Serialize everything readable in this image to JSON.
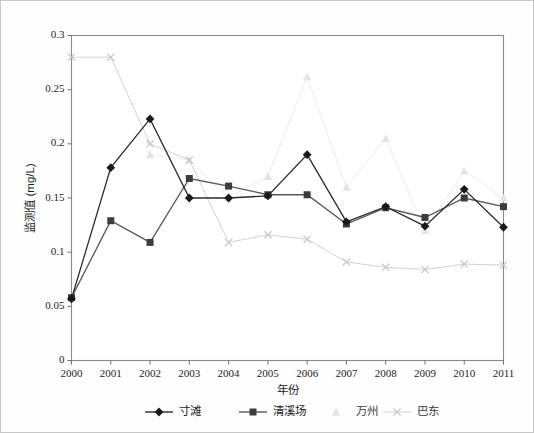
{
  "chart_data": {
    "type": "line",
    "title": "",
    "xlabel": "年份",
    "ylabel": "监测值 (mg/L)",
    "categories": [
      "2000",
      "2001",
      "2002",
      "2003",
      "2004",
      "2005",
      "2006",
      "2007",
      "2008",
      "2009",
      "2010",
      "2011"
    ],
    "x": [
      2000,
      2001,
      2002,
      2003,
      2004,
      2005,
      2006,
      2007,
      2008,
      2009,
      2010,
      2011
    ],
    "xlim": [
      2000,
      2011
    ],
    "ylim": [
      0,
      0.3
    ],
    "yticks": [
      0,
      0.05,
      0.1,
      0.15,
      0.2,
      0.25,
      0.3
    ],
    "ytick_labels": [
      "0",
      "0.05",
      "0.1",
      "0.15",
      "0.2",
      "0.25",
      "0.3"
    ],
    "grid": false,
    "legend_position": "bottom",
    "series": [
      {
        "name": "寸滩",
        "marker": "diamond",
        "color": "#1a1a1a",
        "line_color": "#2b2b2b",
        "values": [
          0.057,
          0.178,
          0.223,
          0.15,
          0.15,
          0.152,
          0.19,
          0.128,
          0.142,
          0.124,
          0.158,
          0.123
        ]
      },
      {
        "name": "清溪场",
        "marker": "square",
        "color": "#3d3d3d",
        "line_color": "#575757",
        "values": [
          0.058,
          0.129,
          0.109,
          0.168,
          0.161,
          0.153,
          0.153,
          0.126,
          0.141,
          0.132,
          0.15,
          0.142
        ]
      },
      {
        "name": "万州",
        "marker": "triangle",
        "color": "#e4e4e4",
        "line_color": "#ececec",
        "values": [
          null,
          null,
          0.19,
          0.185,
          0.15,
          0.17,
          0.262,
          0.16,
          0.205,
          0.12,
          0.175,
          0.15
        ]
      },
      {
        "name": "巴东",
        "marker": "cross",
        "color": "#c6c6c6",
        "line_color": "#d2d2d2",
        "values": [
          0.28,
          0.28,
          0.2,
          0.185,
          0.109,
          0.116,
          0.112,
          0.091,
          0.086,
          0.084,
          0.089,
          0.088
        ]
      }
    ]
  },
  "legend": {
    "items": [
      {
        "label": "寸滩"
      },
      {
        "label": "清溪场"
      },
      {
        "label": "万州"
      },
      {
        "label": "巴东"
      }
    ]
  }
}
